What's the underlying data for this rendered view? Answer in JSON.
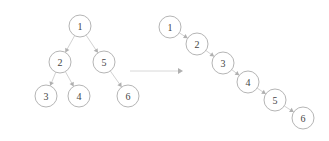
{
  "diagram": {
    "type": "binary-tree-flatten-to-linked-list",
    "colors": {
      "node_stroke": "#b5b5b5",
      "edge": "#d2d2d2",
      "arrow_head": "#b0b0b0",
      "text": "#444444"
    },
    "tree": {
      "nodes": [
        {
          "id": "t1",
          "label": "1",
          "x": 80,
          "y": 26
        },
        {
          "id": "t2",
          "label": "2",
          "x": 60,
          "y": 62
        },
        {
          "id": "t5",
          "label": "5",
          "x": 104,
          "y": 62
        },
        {
          "id": "t3",
          "label": "3",
          "x": 46,
          "y": 96
        },
        {
          "id": "t4",
          "label": "4",
          "x": 79,
          "y": 96
        },
        {
          "id": "t6",
          "label": "6",
          "x": 128,
          "y": 96
        }
      ],
      "edges": [
        {
          "from": "t1",
          "to": "t2"
        },
        {
          "from": "t1",
          "to": "t5"
        },
        {
          "from": "t2",
          "to": "t3"
        },
        {
          "from": "t2",
          "to": "t4"
        },
        {
          "from": "t5",
          "to": "t6"
        }
      ]
    },
    "transform_arrow": {
      "x1": 130,
      "y1": 71,
      "x2": 183,
      "y2": 71
    },
    "list": {
      "nodes": [
        {
          "id": "l1",
          "label": "1",
          "x": 170,
          "y": 27
        },
        {
          "id": "l2",
          "label": "2",
          "x": 197,
          "y": 44
        },
        {
          "id": "l3",
          "label": "3",
          "x": 223,
          "y": 63
        },
        {
          "id": "l4",
          "label": "4",
          "x": 248,
          "y": 82
        },
        {
          "id": "l5",
          "label": "5",
          "x": 275,
          "y": 100
        },
        {
          "id": "l6",
          "label": "6",
          "x": 303,
          "y": 118
        }
      ],
      "edges": [
        {
          "from": "l1",
          "to": "l2"
        },
        {
          "from": "l2",
          "to": "l3"
        },
        {
          "from": "l3",
          "to": "l4"
        },
        {
          "from": "l4",
          "to": "l5"
        },
        {
          "from": "l5",
          "to": "l6"
        }
      ]
    },
    "node_radius": 11
  }
}
